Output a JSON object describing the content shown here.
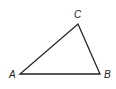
{
  "diagram": {
    "type": "triangle",
    "vertices": [
      {
        "label": "A",
        "x": 20,
        "y": 74
      },
      {
        "label": "B",
        "x": 100,
        "y": 74
      },
      {
        "label": "C",
        "x": 78,
        "y": 24
      }
    ],
    "stroke_color": "#222222"
  }
}
